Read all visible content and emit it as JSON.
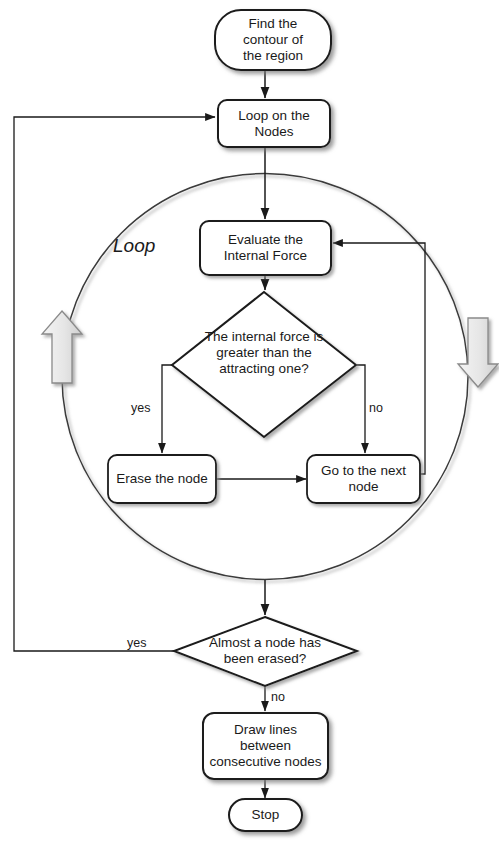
{
  "diagram": {
    "type": "flowchart",
    "title": "",
    "colors": {
      "stroke": "#1a1a1a",
      "fill": "#ffffff",
      "shadow": "#9a9a9a",
      "loop_arrow_fill": "#e8e8e8",
      "loop_arrow_stroke": "#8a8a8a",
      "circle_stroke": "#3a3a3a",
      "text": "#1a1a1a"
    },
    "nodes": [
      {
        "id": "start",
        "shape": "terminator",
        "label": "Find the\ncontour of\nthe region"
      },
      {
        "id": "loopnodes",
        "shape": "process",
        "label": "Loop on the\nNodes"
      },
      {
        "id": "evaluate",
        "shape": "process",
        "label": "Evaluate the\nInternal Force"
      },
      {
        "id": "decide1",
        "shape": "decision",
        "label": "The internal force is\ngreater than the\nattracting one?"
      },
      {
        "id": "erase",
        "shape": "process",
        "label": "Erase the node"
      },
      {
        "id": "nextnode",
        "shape": "process",
        "label": "Go to the next\nnode"
      },
      {
        "id": "decide2",
        "shape": "decision",
        "label": "Almost a node has\nbeen erased?"
      },
      {
        "id": "drawlines",
        "shape": "process",
        "label": "Draw lines\nbetween\nconsecutive nodes"
      },
      {
        "id": "stop",
        "shape": "terminator",
        "label": "Stop"
      }
    ],
    "edge_labels": [
      {
        "id": "yes1",
        "text": "yes"
      },
      {
        "id": "no1",
        "text": "no"
      },
      {
        "id": "yes2",
        "text": "yes"
      },
      {
        "id": "no2",
        "text": "no"
      }
    ],
    "annotations": [
      {
        "id": "loop-region",
        "text": "Loop"
      }
    ]
  }
}
